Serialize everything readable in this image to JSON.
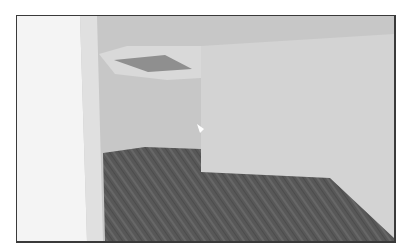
{
  "scene": {
    "type": "3d-room-viewport",
    "colors": {
      "frame_border": "#3a3a3a",
      "background": "#ffffff",
      "left_wall": "#f3f3f3",
      "back_wall": "#c8c8c8",
      "right_wall": "#d4d4d4",
      "ceiling_recess": "#dadada",
      "skylight": "#8e8e8e",
      "floor": "#5a5a5a",
      "floor_grain": "#6b6b6b",
      "cursor": "#ffffff"
    },
    "elements": [
      "left-wall",
      "back-wall",
      "ceiling-skylight",
      "right-wall",
      "wood-floor",
      "pointer-cursor"
    ]
  }
}
